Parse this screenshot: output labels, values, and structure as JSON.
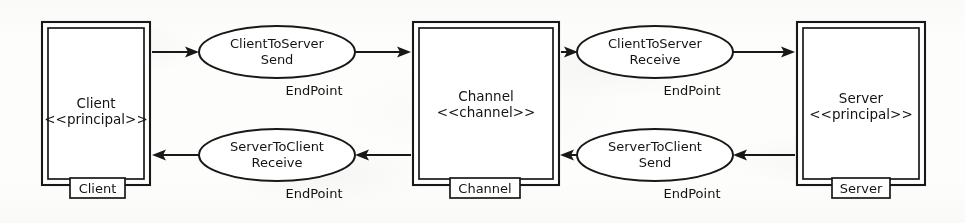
{
  "diagram": {
    "kind": "uml-deployment-diagram",
    "background_color": "#fbfbfa",
    "line_color": "#1a1a1a",
    "nodes": [
      {
        "id": "client",
        "name": "Client",
        "stereotype": "<<principal>>",
        "tab_label": "Client",
        "x": 42,
        "y": 22,
        "width": 108,
        "height": 163
      },
      {
        "id": "channel",
        "name": "Channel",
        "stereotype": "<<channel>>",
        "tab_label": "Channel",
        "x": 413,
        "y": 22,
        "width": 146,
        "height": 163
      },
      {
        "id": "server",
        "name": "Server",
        "stereotype": "<<principal>>",
        "tab_label": "Server",
        "x": 797,
        "y": 22,
        "width": 128,
        "height": 163
      }
    ],
    "endpoints": [
      {
        "id": "client-to-server-send",
        "line1": "ClientToServer",
        "line2": "Send",
        "type_label": "EndPoint",
        "cx": 277,
        "cy": 52,
        "rx": 78,
        "ry": 26,
        "type_label_x": 314,
        "type_label_y": 95
      },
      {
        "id": "client-to-server-receive",
        "line1": "ClientToServer",
        "line2": "Receive",
        "type_label": "EndPoint",
        "cx": 655,
        "cy": 52,
        "rx": 78,
        "ry": 26,
        "type_label_x": 692,
        "type_label_y": 95
      },
      {
        "id": "server-to-client-receive",
        "line1": "ServerToClient",
        "line2": "Receive",
        "type_label": "EndPoint",
        "cx": 277,
        "cy": 155,
        "rx": 78,
        "ry": 26,
        "type_label_x": 314,
        "type_label_y": 198
      },
      {
        "id": "server-to-client-send",
        "line1": "ServerToClient",
        "line2": "Send",
        "type_label": "EndPoint",
        "cx": 655,
        "cy": 155,
        "rx": 78,
        "ry": 26,
        "type_label_x": 692,
        "type_label_y": 198
      }
    ],
    "connections": [
      {
        "id": "client-to-cts-send",
        "from": "client",
        "to": "client-to-server-send",
        "direction": "right"
      },
      {
        "id": "cts-send-to-channel",
        "from": "client-to-server-send",
        "to": "channel",
        "direction": "right"
      },
      {
        "id": "channel-to-cts-receive",
        "from": "channel",
        "to": "client-to-server-receive",
        "direction": "right"
      },
      {
        "id": "cts-receive-to-server",
        "from": "client-to-server-receive",
        "to": "server",
        "direction": "right"
      },
      {
        "id": "server-to-stc-send",
        "from": "server",
        "to": "server-to-client-send",
        "direction": "left"
      },
      {
        "id": "stc-send-to-channel",
        "from": "server-to-client-send",
        "to": "channel",
        "direction": "left"
      },
      {
        "id": "channel-to-stc-receive",
        "from": "channel",
        "to": "server-to-client-receive",
        "direction": "left"
      },
      {
        "id": "stc-receive-to-client",
        "from": "server-to-client-receive",
        "to": "client",
        "direction": "left"
      }
    ]
  }
}
